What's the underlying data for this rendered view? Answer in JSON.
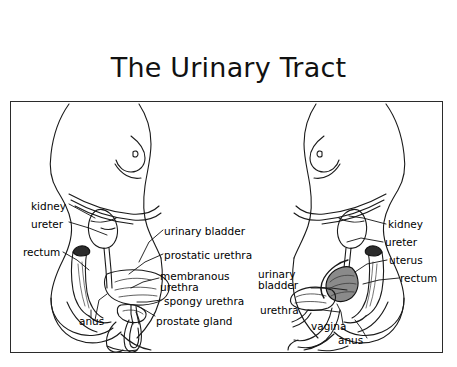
{
  "page": {
    "title": "The Urinary Tract",
    "background_color": "#ffffff",
    "ink_color": "#000000",
    "frame_border_color": "#2b2b2b"
  },
  "diagram": {
    "name": "urinary-tract-comparative-anatomy",
    "style": "black-and-white line drawing, two sagittal body profiles",
    "panels": [
      {
        "id": "male",
        "name": "male-urinary-tract",
        "facing": "right",
        "labels": [
          {
            "id": "kidney",
            "text": "kidney",
            "side": "left",
            "x": 30,
            "y": 200
          },
          {
            "id": "ureter",
            "text": "ureter",
            "side": "left",
            "x": 30,
            "y": 218
          },
          {
            "id": "rectum",
            "text": "rectum",
            "side": "left",
            "x": 22,
            "y": 246
          },
          {
            "id": "anus",
            "text": "anus",
            "side": "left",
            "x": 78,
            "y": 315
          },
          {
            "id": "urinary-bladder",
            "text": "urinary bladder",
            "side": "right",
            "x": 163,
            "y": 226
          },
          {
            "id": "prostatic-urethra",
            "text": "prostatic urethra",
            "side": "right",
            "x": 163,
            "y": 250
          },
          {
            "id": "membranous-urethra",
            "text": "membranous\nurethra",
            "side": "right",
            "x": 152,
            "y": 270
          },
          {
            "id": "spongy-urethra",
            "text": "spongy urethra",
            "side": "right",
            "x": 158,
            "y": 295
          },
          {
            "id": "prostate-gland",
            "text": "prostate gland",
            "side": "right",
            "x": 148,
            "y": 315
          }
        ]
      },
      {
        "id": "female",
        "name": "female-urinary-tract",
        "facing": "left",
        "labels": [
          {
            "id": "kidney",
            "text": "kidney",
            "side": "right",
            "x": 380,
            "y": 218
          },
          {
            "id": "ureter",
            "text": "ureter",
            "side": "right",
            "x": 377,
            "y": 236
          },
          {
            "id": "uterus",
            "text": "uterus",
            "side": "right",
            "x": 381,
            "y": 254
          },
          {
            "id": "rectum",
            "text": "rectum",
            "side": "right",
            "x": 392,
            "y": 272
          },
          {
            "id": "urinary-bladder",
            "text": "urinary\nbladder",
            "side": "left",
            "x": 257,
            "y": 268
          },
          {
            "id": "urethra",
            "text": "urethra",
            "side": "left",
            "x": 259,
            "y": 304
          },
          {
            "id": "vagina",
            "text": "vagina",
            "side": "left",
            "x": 310,
            "y": 320
          },
          {
            "id": "anus",
            "text": "anus",
            "side": "left",
            "x": 337,
            "y": 334
          }
        ]
      }
    ]
  }
}
